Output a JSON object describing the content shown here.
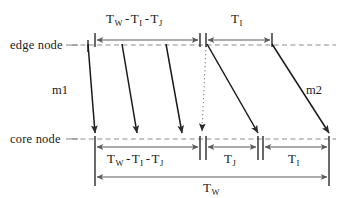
{
  "diagram": {
    "type": "timing-diagram",
    "title": "",
    "node_lines": [
      {
        "id": "edge",
        "label": "edge node",
        "y": 45
      },
      {
        "id": "core",
        "label": "core node",
        "y": 139
      }
    ],
    "message_arrows": [
      {
        "name": "m1",
        "label": "m1",
        "style": "solid",
        "x_start": 88,
        "x_end": 95,
        "y_start": 45,
        "y_end": 139
      },
      {
        "name": "a2",
        "label": "",
        "style": "solid",
        "x_start": 122,
        "x_end": 137,
        "y_start": 45,
        "y_end": 139
      },
      {
        "name": "a3",
        "label": "",
        "style": "solid",
        "x_start": 166,
        "x_end": 182,
        "y_start": 45,
        "y_end": 139
      },
      {
        "name": "a4",
        "label": "",
        "style": "dotted",
        "x_start": 207,
        "x_end": 202,
        "y_start": 45,
        "y_end": 139
      },
      {
        "name": "a5",
        "label": "",
        "style": "solid",
        "x_start": 207,
        "x_end": 258,
        "y_start": 45,
        "y_end": 139
      },
      {
        "name": "m2",
        "label": "m2",
        "style": "solid",
        "x_start": 272,
        "x_end": 329,
        "y_start": 45,
        "y_end": 139
      }
    ],
    "top_dimensions": [
      {
        "name": "top-left-span",
        "x1": 95,
        "x2": 200,
        "parts": [
          {
            "t": "T",
            "sub": "W"
          },
          {
            "op": "-"
          },
          {
            "t": "T",
            "sub": "I"
          },
          {
            "op": "-"
          },
          {
            "t": "T",
            "sub": "J"
          }
        ]
      },
      {
        "name": "top-right-span",
        "x1": 206,
        "x2": 272,
        "parts": [
          {
            "t": "T",
            "sub": "I"
          }
        ]
      }
    ],
    "bottom_dimensions": [
      {
        "name": "bottom-left-span",
        "x1": 95,
        "x2": 200,
        "parts": [
          {
            "t": "T",
            "sub": "W"
          },
          {
            "op": "-"
          },
          {
            "t": "T",
            "sub": "I"
          },
          {
            "op": "-"
          },
          {
            "t": "T",
            "sub": "J"
          }
        ]
      },
      {
        "name": "bottom-mid-span",
        "x1": 206,
        "x2": 258,
        "parts": [
          {
            "t": "T",
            "sub": "J"
          }
        ]
      },
      {
        "name": "bottom-right-span",
        "x1": 263,
        "x2": 329,
        "parts": [
          {
            "t": "T",
            "sub": "I"
          }
        ]
      },
      {
        "name": "bottom-total-span",
        "x1": 95,
        "x2": 329,
        "parts": [
          {
            "t": "T",
            "sub": "W"
          }
        ]
      }
    ],
    "labels": {
      "edge_node": "edge node",
      "core_node": "core node",
      "m1": "m1",
      "m2": "m2",
      "T": "T",
      "sub_W": "W",
      "sub_I": "I",
      "sub_J": "J",
      "minus": "-"
    },
    "colors": {
      "line": "#1a1a1a",
      "dashed_guide": "#8c8c8c",
      "dimension": "#5a5a5a",
      "background": "#ffffff"
    }
  }
}
